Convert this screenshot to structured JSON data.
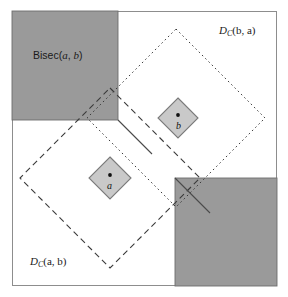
{
  "figure": {
    "canvas": {
      "width": 288,
      "height": 297,
      "background": "#ffffff"
    },
    "frame": {
      "name": "bounding-frame",
      "x": 12,
      "y": 11,
      "width": 265,
      "height": 275,
      "stroke": "#8d8d8d",
      "stroke_width": 1,
      "fill": "#ffffff"
    },
    "colors": {
      "region_gray": "#9a9a9a",
      "region_gray_stroke": "#6e6e6e",
      "site_gray": "#c9c9c9",
      "site_stroke": "#7a7a7a",
      "line_dark": "#3a3a3a",
      "frame": "#8d8d8d",
      "text": "#1a1a1a"
    },
    "regions": [
      {
        "id": "bisec-upper-left",
        "name": "bisector-region-upper-left",
        "shape": "square",
        "x": 12,
        "y": 11,
        "width": 106,
        "height": 109,
        "fill": "#9a9a9a"
      },
      {
        "id": "bisec-lower-right",
        "name": "bisector-region-lower-right",
        "shape": "square",
        "x": 175,
        "y": 178,
        "width": 102,
        "height": 108,
        "fill": "#9a9a9a"
      }
    ],
    "sites": [
      {
        "id": "a",
        "name": "site-a",
        "label": "a",
        "shape": "diamond",
        "center_x": 110,
        "center_y": 178,
        "radius": 21,
        "fill": "#c9c9c9",
        "label_dx": -3,
        "label_dy": 8,
        "dot_radius": 1.9
      },
      {
        "id": "b",
        "name": "site-b",
        "label": "b",
        "shape": "diamond",
        "center_x": 178,
        "center_y": 118,
        "radius": 20,
        "fill": "#c9c9c9",
        "label_dx": -2,
        "label_dy": 8,
        "dot_radius": 1.9
      }
    ],
    "distance_regions": [
      {
        "id": "dc_a_b",
        "name": "distance-region-dc-a-b",
        "label": "D_C(a, b)",
        "label_main": "D",
        "label_sub": "C",
        "label_args": "(a, b)",
        "style": "dashed",
        "shape": "diamond",
        "center_x": 110,
        "center_y": 178,
        "radius": 90,
        "stroke": "#3a3a3a",
        "dash": "6 4",
        "label_x": 30,
        "label_y": 262
      },
      {
        "id": "dc_b_a",
        "name": "distance-region-dc-b-a",
        "label": "D_C(b, a)",
        "label_main": "D",
        "label_sub": "C",
        "label_args": "(b, a)",
        "style": "dotted",
        "shape": "diamond",
        "center_x": 176,
        "center_y": 118,
        "radius": 89,
        "stroke": "#3a3a3a",
        "dash": "1.6 3",
        "label_x": 219,
        "label_y": 31
      }
    ],
    "bisector_label": {
      "name": "bisector-label",
      "text_prefix": "Bisec(",
      "text_a": "a",
      "text_comma": ", ",
      "text_b": "b",
      "text_suffix": ")",
      "full": "Bisec(a, b)",
      "x": 33,
      "y": 57
    },
    "bisector_path": {
      "name": "bisector-staircase-path",
      "description": "staircase boundary between the two distance regions",
      "stroke": "#4a4a4a",
      "points": "118,120 118,11"
    }
  }
}
